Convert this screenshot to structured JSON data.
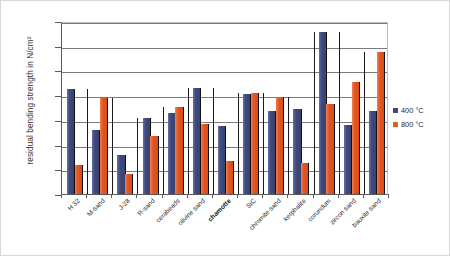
{
  "chart_data": {
    "type": "bar",
    "title": "",
    "xlabel": "",
    "ylabel": "residual bending strength in N/cm²",
    "ylim": [
      0,
      350
    ],
    "ytick_step": 50,
    "yticks": [
      0,
      50,
      100,
      150,
      200,
      250,
      300,
      350
    ],
    "grid": true,
    "legend_position": "right",
    "categories": [
      "H 32",
      "M-sand",
      "J-28",
      "R-sand",
      "cerabeads",
      "olivine sand",
      "chamotte",
      "SiC",
      "chromite sand",
      "kerphalite",
      "corundum",
      "zircon sand",
      "bauxite sand"
    ],
    "emphasized_category": "chamotte",
    "series": [
      {
        "name": "400 °C",
        "color": "#3B4A7A",
        "values": [
          213,
          130,
          79,
          154,
          164,
          215,
          138,
          202,
          168,
          172,
          328,
          140,
          168
        ]
      },
      {
        "name": "800 °C",
        "color": "#E05A2B",
        "values": [
          59,
          194,
          41,
          118,
          177,
          141,
          67,
          205,
          196,
          62,
          183,
          227,
          288
        ]
      }
    ]
  },
  "legend": {
    "items": [
      {
        "label": "400 °C",
        "color": "#3B4A7A"
      },
      {
        "label": "800 °C",
        "color": "#E05A2B"
      }
    ]
  },
  "axis": {
    "y_title": "residual bending strength in N/cm²"
  }
}
